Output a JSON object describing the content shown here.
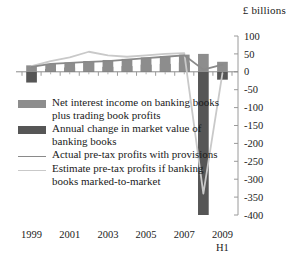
{
  "chart_data": {
    "type": "bar",
    "title": "",
    "subtitle": "",
    "unit_label": "£ billions",
    "xlabel": "",
    "ylabel": "",
    "ylim": [
      -400,
      100
    ],
    "ytick_step": 50,
    "yticks": [
      100,
      50,
      0,
      -50,
      -100,
      -150,
      -200,
      -250,
      -300,
      -350,
      -400
    ],
    "ytick_labels": [
      "100",
      "50",
      "0",
      "-50",
      "-100",
      "-150",
      "-200",
      "-250",
      "-300",
      "-350",
      "-400"
    ],
    "categories": [
      "1999",
      "2000",
      "2001",
      "2002",
      "2003",
      "2004",
      "2005",
      "2006",
      "2007",
      "2008",
      "2009 H1"
    ],
    "xtick_labels": [
      "1999",
      "2001",
      "2003",
      "2005",
      "2007",
      "2009"
    ],
    "xtick_sublabel": "H1",
    "xtick_categories": [
      "1999",
      "2001",
      "2003",
      "2005",
      "2007",
      "2009 H1"
    ],
    "grid": false,
    "legend_position": "below-plot-left",
    "series": [
      {
        "name": "Net interest income on banking books plus trading book profits",
        "type": "bar",
        "color": "#8d8d8d",
        "values": [
          18,
          22,
          26,
          30,
          33,
          36,
          40,
          44,
          48,
          50,
          28
        ]
      },
      {
        "name": "Annual change in market value of banking books",
        "type": "bar",
        "color": "#565656",
        "values": [
          -30,
          8,
          12,
          30,
          14,
          16,
          20,
          22,
          26,
          -400,
          -22
        ]
      },
      {
        "name": "Actual pre-tax profits with provisions",
        "type": "line",
        "color": "#8a8a8a",
        "values": [
          14,
          22,
          25,
          28,
          30,
          34,
          38,
          42,
          46,
          6,
          20
        ]
      },
      {
        "name": "Estimate pre-tax profits if banking books marked-to-market",
        "type": "line",
        "color": "#c9c9c9",
        "values": [
          16,
          30,
          40,
          56,
          46,
          42,
          46,
          50,
          52,
          -340,
          -4
        ]
      }
    ]
  },
  "legend": {
    "entries": [
      {
        "label": "Net interest income on banking books plus trading book profits",
        "marker": "box",
        "color": "#8d8d8d",
        "name": "legend-net-interest-income"
      },
      {
        "label": "Annual change in market value of banking books",
        "marker": "box",
        "color": "#565656",
        "name": "legend-annual-change-market-value"
      },
      {
        "label": "Actual pre-tax profits with provisions",
        "marker": "line",
        "color": "#8a8a8a",
        "name": "legend-actual-pretax-profits"
      },
      {
        "label": "Estimate pre-tax profits if banking books marked-to-market",
        "marker": "line",
        "color": "#c9c9c9",
        "name": "legend-estimate-pretax-profits"
      }
    ]
  }
}
